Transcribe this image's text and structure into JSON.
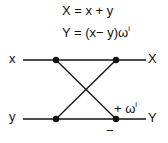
{
  "equations": {
    "line1": "X = x  +  y",
    "line2_prefix": "Y = (x−  y)ω",
    "line2_sup": "i"
  },
  "inputs": {
    "top": "x",
    "bottom": "y"
  },
  "outputs": {
    "top": "X",
    "bottom": "Y"
  },
  "annotations": {
    "plus_prefix": "+ ω",
    "plus_sup": "i",
    "minus": "−"
  }
}
